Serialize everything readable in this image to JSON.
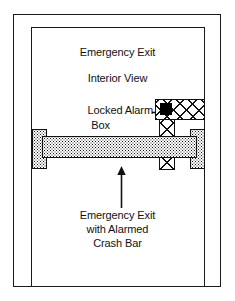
{
  "diagram": {
    "name": "emergency-exit-interior-view",
    "width": 235,
    "height": 301,
    "background_color": "#ffffff",
    "line_color": "#1a1a1a"
  },
  "title": {
    "line1": "Emergency Exit",
    "line2": "Interior View"
  },
  "annotations": {
    "alarm_box": {
      "line1": "Locked Alarm",
      "line2": "Box",
      "pointer": "arrow-right",
      "target": "alarm-box"
    },
    "crash_bar": {
      "line1": "Emergency Exit",
      "line2": "with Alarmed",
      "line3": "Crash Bar",
      "pointer": "arrow-up",
      "target": "crash-bar"
    }
  },
  "components": {
    "door_frame_outer": "outer-door-frame",
    "door_frame_inner": "inner-door-jamb",
    "crash_bar": "horizontal-push-bar",
    "bar_mount_left": "left-mounting-bracket",
    "bar_mount_right": "right-mounting-bracket",
    "alarm_box": "locked-alarm-box",
    "lock_indicator": "lock-keyhole-indicator"
  },
  "textures": {
    "crash_bar_fill": "stipple",
    "alarm_box_fill": "crosshatch",
    "lock_indicator_fill": "#000000"
  }
}
